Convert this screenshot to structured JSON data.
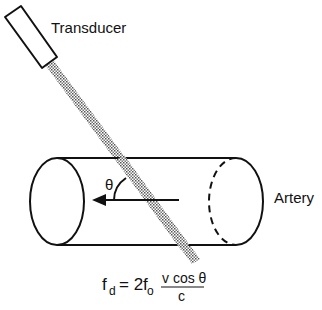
{
  "diagram": {
    "labels": {
      "transducer": "Transducer",
      "artery": "Artery",
      "angle": "θ"
    },
    "equation": {
      "lhs": "f",
      "lhs_sub": "d",
      "equals": "= 2f",
      "rhs_sub": "o",
      "numerator": "v cos θ",
      "denominator": "c"
    },
    "colors": {
      "stroke": "#111111",
      "beam": "#888888",
      "background": "#ffffff"
    }
  }
}
